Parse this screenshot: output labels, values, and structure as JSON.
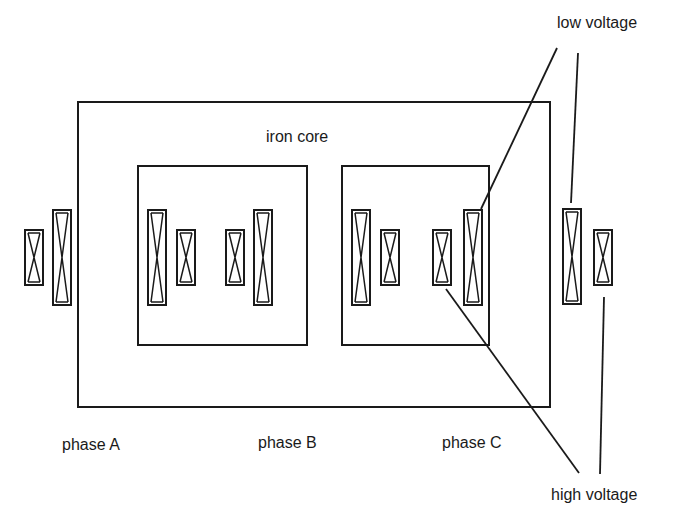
{
  "diagram": {
    "core_label": "iron core",
    "phases": [
      {
        "id": "A",
        "label": "phase A"
      },
      {
        "id": "B",
        "label": "phase B"
      },
      {
        "id": "C",
        "label": "phase C"
      }
    ],
    "callouts": {
      "low_voltage": "low voltage",
      "high_voltage": "high voltage"
    },
    "winding_types": {
      "low_voltage": "tall outer-side winding",
      "high_voltage": "short winding"
    },
    "line_color": "#1a1a1a",
    "background": "#ffffff"
  }
}
